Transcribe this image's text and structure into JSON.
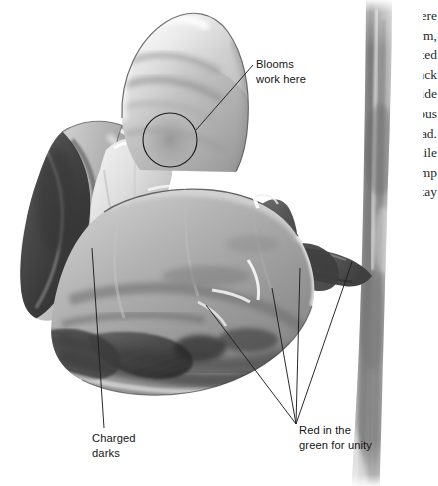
{
  "page": {
    "width": 438,
    "height": 486,
    "background_color": "#ffffff",
    "kind": "grayscale botanical illustration with hand-lettered annotations"
  },
  "annotations": [
    {
      "id": "blooms",
      "lines": [
        "Blooms",
        "work here"
      ],
      "line1": "Blooms",
      "line2": "work here",
      "x": 256,
      "y": 57,
      "leader": {
        "from": [
          252,
          66
        ],
        "to": [
          197,
          130
        ]
      },
      "marker": {
        "type": "circle",
        "cx": 170,
        "cy": 140,
        "r": 27
      }
    },
    {
      "id": "charged-darks",
      "lines": [
        "Charged",
        "darks"
      ],
      "line1": "Charged",
      "line2": "darks",
      "x": 92,
      "y": 431,
      "leader": {
        "from": [
          104,
          428
        ],
        "to": [
          92,
          248
        ]
      }
    },
    {
      "id": "red-in-green",
      "lines": [
        "Red in the",
        "green for unity"
      ],
      "line1": "Red in the",
      "line2": "green for unity",
      "x": 299,
      "y": 423,
      "converge": [
        296,
        424
      ],
      "leader_targets": [
        [
          206,
          305
        ],
        [
          272,
          288
        ],
        [
          300,
          268
        ],
        [
          352,
          262
        ]
      ]
    }
  ],
  "margin_column": {
    "visible": "clipped body text sliver at right page edge",
    "text": "The light source here is strong and warm, and the reflected light bouncing back into the shadow side keeps it luminous rather than dead. Work the darks while the wash is still damp so the edges stay soft."
  },
  "palette": {
    "paper": "#ffffff",
    "ink": "#141414",
    "leader_line": "#2b2b2b",
    "highlight": "#f2f2f2",
    "light_grey": "#d8d8d8",
    "mid_grey": "#a0a0a0",
    "petal_grey": "#949494",
    "shadow_grey": "#6d6d6d",
    "dark_grey": "#4f4f4f",
    "charged_dark": "#3a3a3a",
    "deep_dark": "#2c2c2c",
    "stem_grey": "#8c8c8c",
    "stem_shadow": "#6a6a6a"
  },
  "subject": {
    "name": "flower head with stem",
    "parts": [
      "upper dome petal",
      "left ruffled petal with charged darks",
      "large front petal",
      "right sepal / calyx",
      "curving pedicel",
      "vertical main stem"
    ]
  }
}
